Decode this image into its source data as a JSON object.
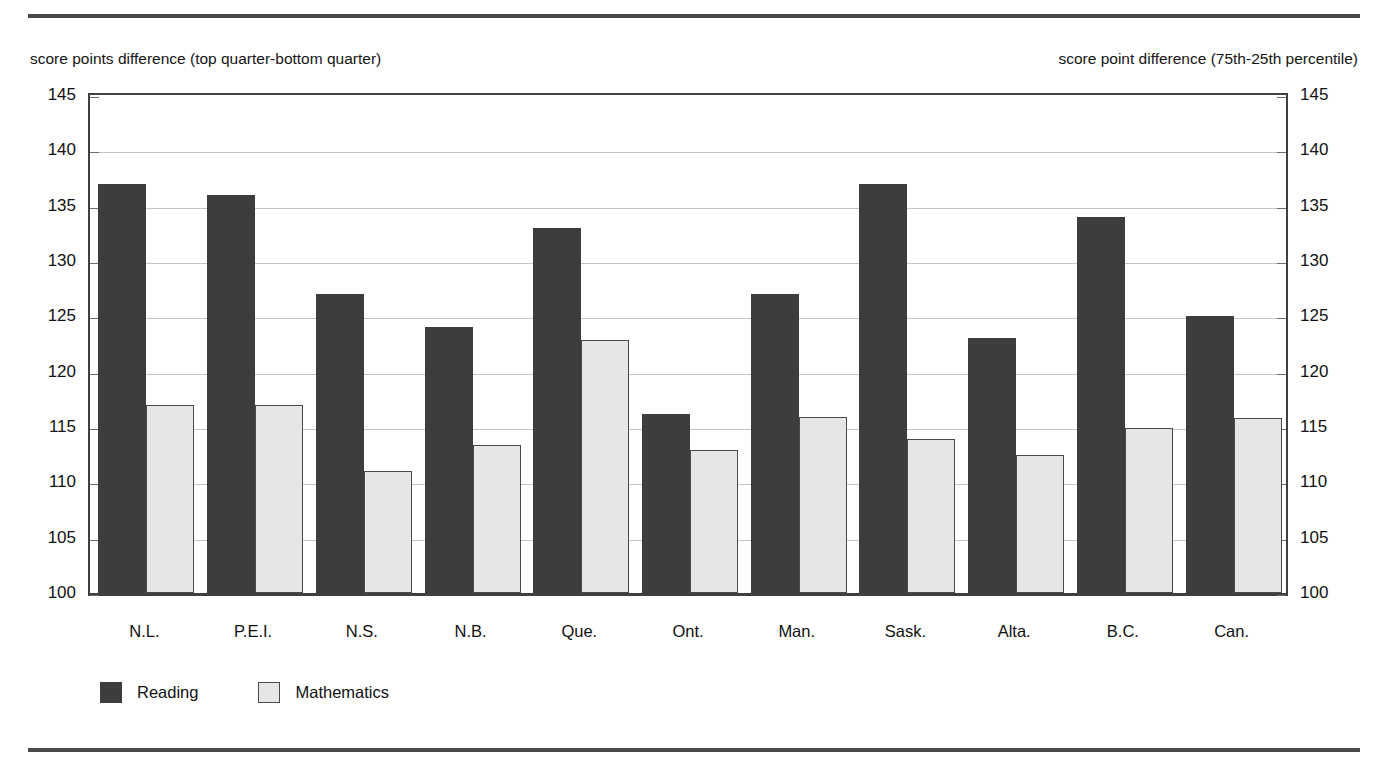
{
  "figure": {
    "title_clipped": "",
    "left_caption": "score points difference (top quarter-bottom quarter)",
    "right_caption": "score point difference (75th-25th percentile)"
  },
  "legend": {
    "items": [
      {
        "label": "Reading",
        "color": "#3d3d3d",
        "swatch": "filled-dark-square"
      },
      {
        "label": "Mathematics",
        "color": "#e6e6e6",
        "swatch": "outlined-light-square"
      }
    ]
  },
  "axis": {
    "y_ticks": [
      "145",
      "140",
      "135",
      "130",
      "125",
      "120",
      "115",
      "110",
      "105",
      "100"
    ],
    "y_min": 100,
    "y_max": 145,
    "y_step": 5
  },
  "chart_data": {
    "type": "bar",
    "title": "",
    "xlabel": "",
    "ylabel": "score points difference (top quarter-bottom quarter)",
    "ylim": [
      100,
      145
    ],
    "grid": true,
    "legend_position": "bottom-left",
    "categories": [
      "N.L.",
      "P.E.I.",
      "N.S.",
      "N.B.",
      "Que.",
      "Ont.",
      "Man.",
      "Sask.",
      "Alta.",
      "B.C.",
      "Can."
    ],
    "series": [
      {
        "name": "Reading",
        "color": "#3d3d3d",
        "values": [
          137,
          136,
          127,
          124,
          133,
          116.2,
          127,
          137,
          123,
          134,
          125
        ]
      },
      {
        "name": "Mathematics",
        "color": "#e6e6e6",
        "values": [
          117,
          117,
          111,
          113.4,
          122.9,
          112.9,
          115.9,
          113.9,
          112.5,
          114.9,
          115.8
        ]
      }
    ]
  }
}
